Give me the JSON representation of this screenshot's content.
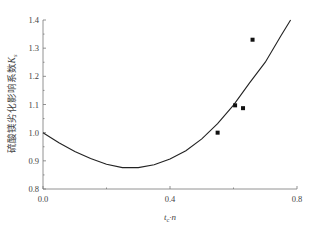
{
  "chart_data": {
    "type": "line",
    "title": "",
    "xlabel": "t_c·n",
    "ylabel": "硫酸镁劣化影响系数K_s",
    "xlim": [
      0.0,
      0.8
    ],
    "ylim": [
      0.8,
      1.4
    ],
    "x_ticks": [
      "0.0",
      "0.4",
      "0.8"
    ],
    "y_ticks": [
      "0.8",
      "0.9",
      "1.0",
      "1.1",
      "1.2",
      "1.3",
      "1.4"
    ],
    "grid": false,
    "legend": null,
    "series": [
      {
        "name": "fitted curve",
        "kind": "line",
        "x": [
          0.0,
          0.05,
          0.1,
          0.15,
          0.2,
          0.25,
          0.3,
          0.35,
          0.4,
          0.45,
          0.5,
          0.55,
          0.6,
          0.65,
          0.7,
          0.75,
          0.78
        ],
        "y": [
          1.0,
          0.964,
          0.933,
          0.908,
          0.888,
          0.876,
          0.876,
          0.886,
          0.906,
          0.936,
          0.978,
          1.032,
          1.098,
          1.176,
          1.25,
          1.345,
          1.4
        ]
      },
      {
        "name": "test data",
        "kind": "scatter",
        "marker": "square",
        "x": [
          0.55,
          0.605,
          0.63,
          0.66
        ],
        "y": [
          1.0,
          1.097,
          1.087,
          1.33
        ]
      }
    ]
  },
  "labels": {
    "ylabel": "硫酸镁劣化影响系数",
    "ylabel_sym": "K",
    "ylabel_sub": "s",
    "xlabel_t": "t",
    "xlabel_sub": "c",
    "xlabel_rest": "·n"
  }
}
